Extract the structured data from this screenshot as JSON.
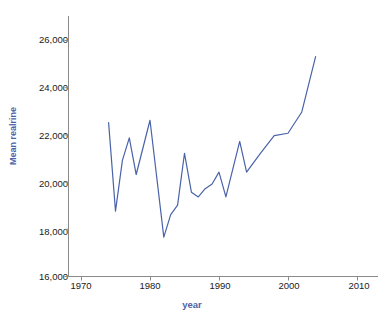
{
  "chart_data": {
    "type": "line",
    "title": "",
    "xlabel": "year",
    "ylabel": "Mean realrine",
    "xlim": [
      1965,
      2012
    ],
    "ylim": [
      16000,
      26700
    ],
    "grid": false,
    "legend": null,
    "xticks": [
      1970,
      1980,
      1990,
      2000,
      2010
    ],
    "xtick_labels": [
      "1970",
      "1980",
      "1990",
      "2000",
      "2010"
    ],
    "yticks": [
      16000,
      18000,
      20000,
      22000,
      24000,
      26000
    ],
    "ytick_labels": [
      "16,000",
      "18,000",
      "20,000",
      "22,000",
      "24,000",
      "26,000"
    ],
    "line_color": "#4a63a8",
    "series": [
      {
        "name": "Mean realrine",
        "x": [
          1974,
          1975,
          1976,
          1977,
          1978,
          1980,
          1982,
          1983,
          1984,
          1985,
          1986,
          1987,
          1988,
          1989,
          1990,
          1991,
          1993,
          1994,
          1996,
          1998,
          2000,
          2002,
          2004
        ],
        "values": [
          22500,
          18750,
          20900,
          21850,
          20300,
          22600,
          17650,
          18600,
          19000,
          21200,
          19550,
          19350,
          19700,
          19900,
          20400,
          19350,
          21700,
          20400,
          21200,
          21950,
          22050,
          22950,
          25300
        ]
      }
    ]
  },
  "axis": {
    "y_axis_name": "y-axis",
    "x_axis_name": "x-axis"
  }
}
